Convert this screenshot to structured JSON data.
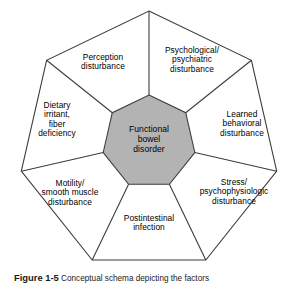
{
  "figure": {
    "center": {
      "label": "Functional\nbowel\ndisorder",
      "fill_color": "#b3b3b3",
      "stroke_color": "#3d3d3d"
    },
    "outer": {
      "fill_color": "#ffffff",
      "stroke_color": "#3d3d3d"
    },
    "sectors": [
      {
        "id": "psychological-psychiatric-disturbance",
        "label": "Psychological/\npsychiatric\ndisturbance"
      },
      {
        "id": "learned-behavioral-disturbance",
        "label": "Learned\nbehavioral\ndisturbance"
      },
      {
        "id": "stress-psychophysiologic-disturbance",
        "label": "Stress/\npsychophysiologic\ndisturbance"
      },
      {
        "id": "postintestinal-infection",
        "label": "Postintestinal\ninfection"
      },
      {
        "id": "motility-smooth-muscle-disturbance",
        "label": "Motility/\nsmooth muscle\ndisturbance"
      },
      {
        "id": "dietary-irritant-fiber-deficiency",
        "label": "Dietary\nirritant,\nfiber\ndeficiency"
      },
      {
        "id": "perception-disturbance",
        "label": "Perception\ndisturbance"
      }
    ]
  },
  "caption": {
    "number": "Figure 1-5",
    "text": "Conceptual schema depicting the factors"
  },
  "chart_data": {
    "type": "diagram",
    "hub": "Functional bowel disorder",
    "spokes": [
      "Psychological/psychiatric disturbance",
      "Learned behavioral disturbance",
      "Stress/psychophysiologic disturbance",
      "Postintestinal infection",
      "Motility/smooth muscle disturbance",
      "Dietary irritant, fiber deficiency",
      "Perception disturbance"
    ],
    "geometry": {
      "outer_polygon_sides": 7,
      "inner_polygon_sides": 7,
      "center_xy": [
        149,
        142
      ],
      "outer_radius": 131,
      "inner_radius": 47
    }
  }
}
